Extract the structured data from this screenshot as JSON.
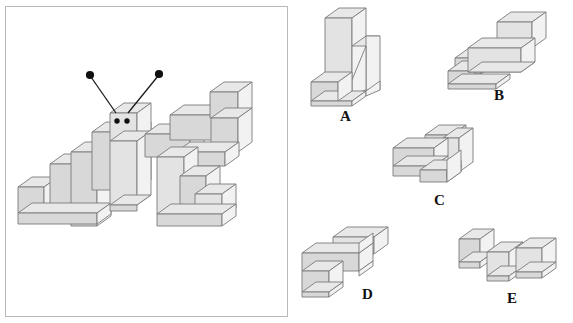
{
  "page": {
    "width": 573,
    "height": 323,
    "background": "#ffffff",
    "kind": "spatial-reasoning-block-puzzle"
  },
  "colors": {
    "top_face": "#e8e8e8",
    "left_face": "#d8d8d8",
    "right_face": "#f2f2f2",
    "front_face": "#e3e3e3",
    "outline": "#7a7a7a",
    "panel_border": "#b9b9b9",
    "antenna_line": "#1a1a1a",
    "antenna_dot": "#101010",
    "eye": "#101010",
    "label_text": "#111111"
  },
  "stimulus": {
    "name": "caterpillar-figure",
    "description": "Isometric block caterpillar with head, two antennae, two eyes, stepped body segments and legs",
    "antennae": [
      {
        "tip_x": 91,
        "tip_y": 75,
        "base_x": 116,
        "base_y": 113
      },
      {
        "tip_x": 159,
        "tip_y": 74,
        "base_x": 128,
        "base_y": 113
      }
    ],
    "eyes": [
      {
        "cx": 117,
        "cy": 121,
        "r": 2.6
      },
      {
        "cx": 127,
        "cy": 121,
        "r": 2.6
      }
    ]
  },
  "options": [
    {
      "id": "A",
      "label": "A",
      "label_x": 340,
      "label_y": 109
    },
    {
      "id": "B",
      "label": "B",
      "label_x": 494,
      "label_y": 88
    },
    {
      "id": "C",
      "label": "C",
      "label_x": 434,
      "label_y": 193
    },
    {
      "id": "D",
      "label": "D",
      "label_x": 362,
      "label_y": 287
    },
    {
      "id": "E",
      "label": "E",
      "label_x": 507,
      "label_y": 291
    }
  ]
}
